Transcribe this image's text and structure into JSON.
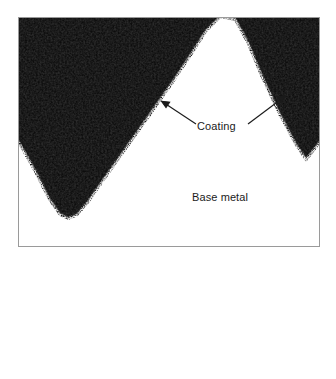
{
  "figure": {
    "type": "photomicrograph",
    "image_region": {
      "x": 18,
      "y": 17,
      "width": 302,
      "height": 230
    },
    "colors": {
      "field_dark": "#0d0d0d",
      "base_metal_white": "#ffffff",
      "coating_speckle": "#f2f2f2",
      "annotation": "#1b1b1b",
      "page_background": "#ffffff"
    }
  },
  "annotations": {
    "coating": {
      "label": "Coating",
      "leaders": [
        {
          "name": "left-leader",
          "from_x": 196,
          "from_y": 124,
          "to_x": 163,
          "to_y": 102
        },
        {
          "name": "right-leader",
          "from_x": 248,
          "from_y": 124,
          "to_x": 284,
          "to_y": 97
        }
      ]
    },
    "base_metal": {
      "label": "Base metal"
    }
  },
  "geometry": {
    "profile_note": "Sawtooth base-metal profile: valley at left, peak near center-right",
    "valley_bottom": {
      "x": 78,
      "y": 222
    },
    "peak_apex": {
      "x": 228,
      "y": 22
    },
    "right_valley_descent_edge_y": 150,
    "coating_band_thickness_px": 9
  }
}
